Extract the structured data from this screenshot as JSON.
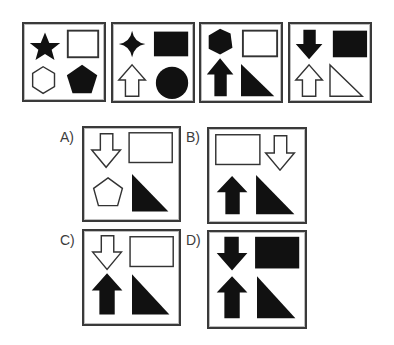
{
  "puzzle": {
    "sequence": [
      {
        "id": "seq-1",
        "cells": [
          "star-filled",
          "rectangle-outline",
          "hexagon-outline",
          "pentagon-filled"
        ]
      },
      {
        "id": "seq-2",
        "cells": [
          "four-point-star-filled",
          "rectangle-filled",
          "arrow-up-outline",
          "circle-filled"
        ]
      },
      {
        "id": "seq-3",
        "cells": [
          "hexagon-filled",
          "rectangle-outline",
          "arrow-up-filled",
          "right-triangle-filled"
        ]
      },
      {
        "id": "seq-4",
        "cells": [
          "arrow-down-filled",
          "rectangle-filled",
          "arrow-up-outline",
          "right-triangle-outline"
        ]
      }
    ],
    "options": [
      {
        "label": "A)",
        "cells": [
          "arrow-down-outline",
          "rectangle-outline",
          "pentagon-outline",
          "right-triangle-filled"
        ]
      },
      {
        "label": "B)",
        "cells": [
          "rectangle-outline",
          "arrow-down-outline",
          "arrow-up-filled",
          "right-triangle-filled"
        ]
      },
      {
        "label": "C)",
        "cells": [
          "arrow-down-outline",
          "rectangle-outline",
          "arrow-up-filled",
          "right-triangle-filled"
        ]
      },
      {
        "label": "D)",
        "cells": [
          "arrow-down-filled",
          "rectangle-filled",
          "arrow-up-filled",
          "right-triangle-filled"
        ]
      }
    ]
  },
  "colors": {
    "shape": "#111111",
    "border": "#3a3a3a",
    "label": "#3c3c3c",
    "background": "#ffffff"
  }
}
